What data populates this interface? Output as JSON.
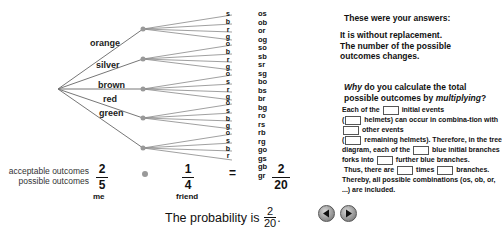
{
  "tree": {
    "level1": [
      "orange",
      "silver",
      "brown",
      "red",
      "green"
    ],
    "level2": [
      [
        "s",
        "b",
        "r",
        "g"
      ],
      [
        "o",
        "b",
        "r",
        "g"
      ],
      [
        "o",
        "s",
        "r",
        "g"
      ],
      [
        "o",
        "s",
        "b",
        "g"
      ],
      [
        "o",
        "s",
        "b",
        "r"
      ]
    ],
    "combinations": [
      "os",
      "ob",
      "or",
      "og",
      "so",
      "sb",
      "sr",
      "sg",
      "bo",
      "bs",
      "br",
      "bg",
      "ro",
      "rs",
      "rb",
      "rg",
      "go",
      "gs",
      "gb",
      "gr"
    ]
  },
  "calculation": {
    "label_acceptable": "acceptable outcomes",
    "label_possible": "possible outcomes",
    "me": {
      "numerator": "2",
      "denominator": "5",
      "label": "me"
    },
    "friend": {
      "numerator": "1",
      "denominator": "4",
      "label": "friend"
    },
    "equals": "=",
    "result": {
      "numerator": "2",
      "denominator": "20"
    }
  },
  "probability": {
    "prefix": "The probability is",
    "numerator": "2",
    "denominator": "20",
    "suffix": "."
  },
  "answers": {
    "heading": "These were your answers:",
    "line1": "It is without replacement.",
    "line2": "The number of the possible outcomes changes."
  },
  "question": {
    "why": "Why",
    "part1": " do you calculate the total possible outcomes by ",
    "multiplying": "multiplying",
    "end": "?"
  },
  "explanation": {
    "s1": "Each of the",
    "s2": "initial events",
    "s3": "(",
    "s4": "helmets) can occur in combina-tion with",
    "s5": "other events",
    "s6": "(",
    "s7": "remaining helmets). Therefore, in the tree diagram, each of the",
    "s8": "blue initial branches forks into",
    "s9": "further blue branches.",
    "s10": "Thus, there are",
    "s11": "times",
    "s12": "branches.",
    "s13": "Thereby, all possible combinations (os, ob, or, ...) are included."
  },
  "nav": {
    "back": "back",
    "forward": "forward"
  }
}
